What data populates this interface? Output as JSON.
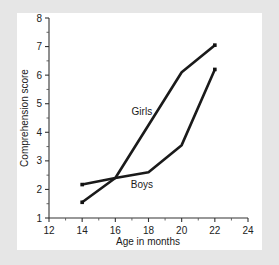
{
  "figure": {
    "background_color": "#e6e6e6",
    "panel_color": "#ffffff",
    "line_color": "#1a1a1a"
  },
  "chart_data": {
    "type": "line",
    "title": "",
    "xlabel": "Age in months",
    "ylabel": "Comprehension score",
    "xlim": [
      12,
      24
    ],
    "ylim": [
      1,
      8
    ],
    "xticks": [
      12,
      14,
      16,
      18,
      20,
      22,
      24
    ],
    "xtick_labels": [
      "12",
      "14",
      "16",
      "18",
      "20",
      "22",
      "24"
    ],
    "x_minor_ticks": [
      13,
      15,
      17,
      19,
      21,
      23
    ],
    "yticks": [
      1,
      2,
      3,
      4,
      5,
      6,
      7,
      8
    ],
    "ytick_labels": [
      "1",
      "2",
      "3",
      "4",
      "5",
      "6",
      "7",
      "8"
    ],
    "y_minor_ticks": [
      1.5,
      2.5,
      3.5,
      4.5,
      5.5,
      6.5,
      7.5
    ],
    "grid": false,
    "legend_position": "inline-annotation",
    "x": [
      14,
      16,
      18,
      20,
      22
    ],
    "series": [
      {
        "name": "Girls",
        "label": "Girls",
        "values": [
          1.55,
          2.4,
          3.5,
          6.1,
          7.05
        ],
        "vertices_x": [
          14,
          16,
          20,
          22
        ],
        "vertices_y": [
          1.55,
          2.4,
          6.1,
          7.05
        ],
        "annotation": {
          "text": "Girls",
          "x": 17.6,
          "y": 4.6
        }
      },
      {
        "name": "Boys",
        "label": "Boys",
        "values": [
          2.17,
          2.4,
          2.6,
          3.55,
          6.2
        ],
        "vertices_x": [
          14,
          16,
          18,
          20,
          22
        ],
        "vertices_y": [
          2.17,
          2.4,
          2.6,
          3.55,
          6.2
        ],
        "annotation": {
          "text": "Boys",
          "x": 17.6,
          "y": 2.05
        }
      }
    ]
  }
}
